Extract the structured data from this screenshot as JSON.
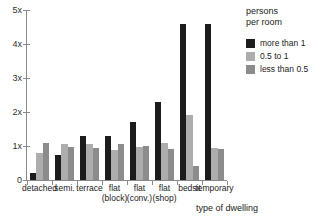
{
  "chart_data": {
    "type": "bar",
    "title": "",
    "subtitle": "",
    "xlabel": "type of dwelling",
    "ylabel": "",
    "grid": false,
    "legend_position": "right",
    "legend_title_lines": [
      "persons",
      "per room"
    ],
    "ylim": [
      0,
      5
    ],
    "ytick_values": [
      0,
      1,
      2,
      3,
      4,
      5
    ],
    "ytick_labels": [
      "0",
      "1x",
      "2x",
      "3x",
      "4x",
      "5x"
    ],
    "categories": [
      "detached",
      "semi.",
      "terrace",
      "flat (block)",
      "flat (conv.)",
      "flat (shop)",
      "bedsit",
      "temporary"
    ],
    "category_lines": [
      [
        "detached",
        ""
      ],
      [
        "semi.",
        ""
      ],
      [
        "terrace",
        ""
      ],
      [
        "flat",
        "(block)"
      ],
      [
        "flat",
        "(conv.)"
      ],
      [
        "flat",
        "(shop)"
      ],
      [
        "bedsit",
        ""
      ],
      [
        "temporary",
        ""
      ]
    ],
    "series": [
      {
        "name": "more than 1",
        "color": "#1c1c1c",
        "values": [
          0.2,
          0.75,
          1.3,
          1.3,
          1.7,
          2.3,
          4.6,
          4.6
        ]
      },
      {
        "name": "0.5 to 1",
        "color": "#adadad",
        "values": [
          0.8,
          1.07,
          1.07,
          0.87,
          0.97,
          1.1,
          1.9,
          0.95
        ]
      },
      {
        "name": "less than 0.5",
        "color": "#8c8c8c",
        "values": [
          1.1,
          0.97,
          0.95,
          1.05,
          1.0,
          0.9,
          0.42,
          0.9
        ]
      }
    ],
    "colors": {
      "axis": "#8a8a8a",
      "text": "#222222",
      "background": "#ffffff"
    }
  }
}
